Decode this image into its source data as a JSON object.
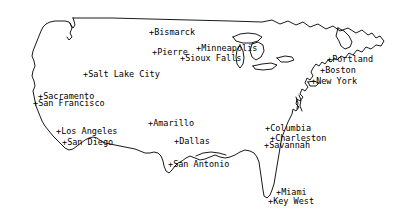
{
  "map": {
    "title": "United States city location map",
    "projection_style": "line-outline",
    "background_color": "#ffffff",
    "outline_color": "#000000",
    "label_color": "#000000",
    "marker_glyph": "+",
    "width": 403,
    "height": 219
  },
  "cities": [
    {
      "name": "Bismarck",
      "marker": "+",
      "x": 149,
      "y": 28,
      "label_anchor": "left"
    },
    {
      "name": "Pierre",
      "marker": "+",
      "x": 152,
      "y": 48,
      "label_anchor": "left"
    },
    {
      "name": "Minneapolis",
      "marker": "+",
      "x": 196,
      "y": 44,
      "label_anchor": "left"
    },
    {
      "name": "Sioux Falls",
      "marker": "+",
      "x": 180,
      "y": 54,
      "label_anchor": "left"
    },
    {
      "name": "Salt Lake City",
      "marker": "+",
      "x": 83,
      "y": 70,
      "label_anchor": "left"
    },
    {
      "name": "Portland",
      "marker": "+",
      "x": 327,
      "y": 55,
      "label_anchor": "left"
    },
    {
      "name": "Boston",
      "marker": "+",
      "x": 320,
      "y": 66,
      "label_anchor": "left"
    },
    {
      "name": "New York",
      "marker": "+",
      "x": 311,
      "y": 77,
      "label_anchor": "left"
    },
    {
      "name": "Sacramento",
      "marker": "+",
      "x": 38,
      "y": 92,
      "label_anchor": "left"
    },
    {
      "name": "San Francisco",
      "marker": "+",
      "x": 33,
      "y": 99,
      "label_anchor": "left"
    },
    {
      "name": "Amarillo",
      "marker": "+",
      "x": 148,
      "y": 119,
      "label_anchor": "left"
    },
    {
      "name": "Los Angeles",
      "marker": "+",
      "x": 56,
      "y": 127,
      "label_anchor": "left"
    },
    {
      "name": "Dallas",
      "marker": "+",
      "x": 174,
      "y": 137,
      "label_anchor": "left"
    },
    {
      "name": "San Diego",
      "marker": "+",
      "x": 62,
      "y": 138,
      "label_anchor": "left"
    },
    {
      "name": "Columbia",
      "marker": "+",
      "x": 265,
      "y": 124,
      "label_anchor": "left"
    },
    {
      "name": "Charleston",
      "marker": "+",
      "x": 270,
      "y": 134,
      "label_anchor": "left"
    },
    {
      "name": "Savannah",
      "marker": "+",
      "x": 264,
      "y": 141,
      "label_anchor": "left"
    },
    {
      "name": "San Antonio",
      "marker": "+",
      "x": 168,
      "y": 160,
      "label_anchor": "left"
    },
    {
      "name": "Miami",
      "marker": "+",
      "x": 276,
      "y": 188,
      "label_anchor": "left"
    },
    {
      "name": "Key West",
      "marker": "+",
      "x": 268,
      "y": 197,
      "label_anchor": "left"
    }
  ]
}
